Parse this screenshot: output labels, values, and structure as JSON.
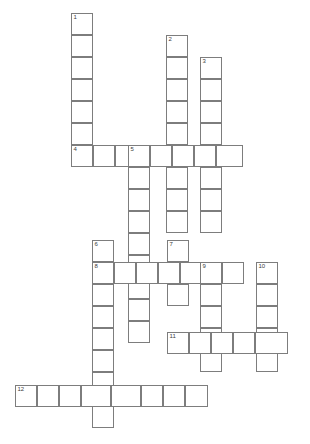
{
  "puzzle": {
    "type": "crossword-grid",
    "title": "",
    "cell_size": 21.8,
    "grid_origin": {
      "x": 15,
      "y": 13
    },
    "colors": {
      "cell_border": "#7d7d7d",
      "cell_fill": "#ffffff",
      "page_background": "#ffffff",
      "number_text": "#3c3c3c"
    },
    "entries": [
      {
        "number": "1",
        "direction": "down",
        "start_col": 3,
        "start_row": 0,
        "length": 7
      },
      {
        "number": "2",
        "direction": "down",
        "start_col": 7,
        "start_row": 1,
        "length": 13
      },
      {
        "number": "3",
        "direction": "down",
        "start_col": 8.5,
        "start_row": 2,
        "length": 12
      },
      {
        "number": "4",
        "direction": "across",
        "start_col": 3,
        "start_row": 6.2,
        "length": 8
      },
      {
        "number": "5",
        "direction": "down",
        "start_col": 5.6,
        "start_row": 6.2,
        "length": 10
      },
      {
        "number": "6",
        "direction": "down",
        "start_col": 4,
        "start_row": 10.4,
        "length": 9
      },
      {
        "number": "7",
        "direction": "down",
        "start_col": 7.2,
        "start_row": 10.4,
        "length": 4
      },
      {
        "number": "8",
        "direction": "across",
        "start_col": 4,
        "start_row": 11.4,
        "length": 7
      },
      {
        "number": "9",
        "direction": "down",
        "start_col": 8.7,
        "start_row": 11.4,
        "length": 5
      },
      {
        "number": "10",
        "direction": "down",
        "start_col": 11.2,
        "start_row": 11.4,
        "length": 5
      },
      {
        "number": "11",
        "direction": "across",
        "start_col": 7.2,
        "start_row": 14.6,
        "length": 5.5
      },
      {
        "number": "12",
        "direction": "across",
        "start_col": 0,
        "start_row": 17,
        "length": 9
      }
    ],
    "cells": [
      {
        "name": "cell-1-1",
        "x": 71,
        "y": 13,
        "w": 22,
        "h": 22,
        "num": "1"
      },
      {
        "name": "cell-1-2",
        "x": 71,
        "y": 35,
        "w": 22,
        "h": 22,
        "num": ""
      },
      {
        "name": "cell-1-3",
        "x": 71,
        "y": 57,
        "w": 22,
        "h": 22,
        "num": ""
      },
      {
        "name": "cell-1-4",
        "x": 71,
        "y": 79,
        "w": 22,
        "h": 22,
        "num": ""
      },
      {
        "name": "cell-1-5",
        "x": 71,
        "y": 101,
        "w": 22,
        "h": 22,
        "num": ""
      },
      {
        "name": "cell-1-6",
        "x": 71,
        "y": 123,
        "w": 22,
        "h": 22,
        "num": ""
      },
      {
        "name": "cell-1-7",
        "x": 71,
        "y": 145,
        "w": 22,
        "h": 22,
        "num": ""
      },
      {
        "name": "cell-2-1",
        "x": 166,
        "y": 35,
        "w": 22,
        "h": 22,
        "num": "2"
      },
      {
        "name": "cell-2-2",
        "x": 166,
        "y": 57,
        "w": 22,
        "h": 22,
        "num": ""
      },
      {
        "name": "cell-2-3",
        "x": 166,
        "y": 79,
        "w": 22,
        "h": 22,
        "num": ""
      },
      {
        "name": "cell-2-4",
        "x": 166,
        "y": 101,
        "w": 22,
        "h": 22,
        "num": ""
      },
      {
        "name": "cell-2-5",
        "x": 166,
        "y": 123,
        "w": 22,
        "h": 22,
        "num": ""
      },
      {
        "name": "cell-2-6",
        "x": 166,
        "y": 145,
        "w": 22,
        "h": 22,
        "num": ""
      },
      {
        "name": "cell-2-7",
        "x": 166,
        "y": 167,
        "w": 22,
        "h": 22,
        "num": ""
      },
      {
        "name": "cell-2-8",
        "x": 166,
        "y": 189,
        "w": 22,
        "h": 22,
        "num": ""
      },
      {
        "name": "cell-2-9",
        "x": 166,
        "y": 211,
        "w": 22,
        "h": 22,
        "num": ""
      },
      {
        "name": "cell-3-1",
        "x": 200,
        "y": 57,
        "w": 22,
        "h": 22,
        "num": "3"
      },
      {
        "name": "cell-3-2",
        "x": 200,
        "y": 79,
        "w": 22,
        "h": 22,
        "num": ""
      },
      {
        "name": "cell-3-3",
        "x": 200,
        "y": 101,
        "w": 22,
        "h": 22,
        "num": ""
      },
      {
        "name": "cell-3-4",
        "x": 200,
        "y": 123,
        "w": 22,
        "h": 22,
        "num": ""
      },
      {
        "name": "cell-3-5",
        "x": 200,
        "y": 145,
        "w": 22,
        "h": 22,
        "num": ""
      },
      {
        "name": "cell-3-6",
        "x": 200,
        "y": 167,
        "w": 22,
        "h": 22,
        "num": ""
      },
      {
        "name": "cell-3-7",
        "x": 200,
        "y": 189,
        "w": 22,
        "h": 22,
        "num": ""
      },
      {
        "name": "cell-3-8",
        "x": 200,
        "y": 211,
        "w": 22,
        "h": 22,
        "num": ""
      },
      {
        "name": "cell-4-1",
        "x": 71,
        "y": 145,
        "w": 22,
        "h": 22,
        "num": "4"
      },
      {
        "name": "cell-4-2",
        "x": 93,
        "y": 145,
        "w": 22,
        "h": 22,
        "num": ""
      },
      {
        "name": "cell-4-3",
        "x": 115,
        "y": 145,
        "w": 22,
        "h": 22,
        "num": ""
      },
      {
        "name": "cell-4-4",
        "x": 128,
        "y": 145,
        "w": 22,
        "h": 22,
        "num": "5"
      },
      {
        "name": "cell-4-5",
        "x": 150,
        "y": 145,
        "w": 22,
        "h": 22,
        "num": ""
      },
      {
        "name": "cell-4-6",
        "x": 172,
        "y": 145,
        "w": 22,
        "h": 22,
        "num": ""
      },
      {
        "name": "cell-4-7",
        "x": 194,
        "y": 145,
        "w": 22,
        "h": 22,
        "num": ""
      },
      {
        "name": "cell-4-8",
        "x": 216,
        "y": 145,
        "w": 27,
        "h": 22,
        "num": ""
      },
      {
        "name": "cell-5-2",
        "x": 128,
        "y": 167,
        "w": 22,
        "h": 22,
        "num": ""
      },
      {
        "name": "cell-5-3",
        "x": 128,
        "y": 189,
        "w": 22,
        "h": 22,
        "num": ""
      },
      {
        "name": "cell-5-4",
        "x": 128,
        "y": 211,
        "w": 22,
        "h": 22,
        "num": ""
      },
      {
        "name": "cell-5-5",
        "x": 128,
        "y": 233,
        "w": 22,
        "h": 22,
        "num": ""
      },
      {
        "name": "cell-5-6",
        "x": 128,
        "y": 255,
        "w": 22,
        "h": 22,
        "num": ""
      },
      {
        "name": "cell-5-7",
        "x": 128,
        "y": 277,
        "w": 22,
        "h": 22,
        "num": ""
      },
      {
        "name": "cell-5-8",
        "x": 128,
        "y": 299,
        "w": 22,
        "h": 22,
        "num": ""
      },
      {
        "name": "cell-5-9",
        "x": 128,
        "y": 321,
        "w": 22,
        "h": 22,
        "num": ""
      },
      {
        "name": "cell-6-1",
        "x": 92,
        "y": 240,
        "w": 22,
        "h": 22,
        "num": "6"
      },
      {
        "name": "cell-6-2",
        "x": 92,
        "y": 262,
        "w": 22,
        "h": 22,
        "num": "8"
      },
      {
        "name": "cell-6-3",
        "x": 92,
        "y": 284,
        "w": 22,
        "h": 22,
        "num": ""
      },
      {
        "name": "cell-6-4",
        "x": 92,
        "y": 306,
        "w": 22,
        "h": 22,
        "num": ""
      },
      {
        "name": "cell-6-5",
        "x": 92,
        "y": 328,
        "w": 22,
        "h": 22,
        "num": ""
      },
      {
        "name": "cell-6-6",
        "x": 92,
        "y": 350,
        "w": 22,
        "h": 22,
        "num": ""
      },
      {
        "name": "cell-6-7",
        "x": 92,
        "y": 372,
        "w": 22,
        "h": 22,
        "num": ""
      },
      {
        "name": "cell-6-8",
        "x": 92,
        "y": 394,
        "w": 22,
        "h": 22,
        "num": ""
      },
      {
        "name": "cell-6-9",
        "x": 92,
        "y": 406,
        "w": 22,
        "h": 22,
        "num": ""
      },
      {
        "name": "cell-7-1",
        "x": 167,
        "y": 240,
        "w": 22,
        "h": 22,
        "num": "7"
      },
      {
        "name": "cell-7-2",
        "x": 167,
        "y": 262,
        "w": 22,
        "h": 22,
        "num": ""
      },
      {
        "name": "cell-7-3",
        "x": 167,
        "y": 284,
        "w": 22,
        "h": 22,
        "num": ""
      },
      {
        "name": "cell-8-2",
        "x": 114,
        "y": 262,
        "w": 22,
        "h": 22,
        "num": ""
      },
      {
        "name": "cell-8-3",
        "x": 136,
        "y": 262,
        "w": 22,
        "h": 22,
        "num": ""
      },
      {
        "name": "cell-8-4",
        "x": 158,
        "y": 262,
        "w": 22,
        "h": 22,
        "num": ""
      },
      {
        "name": "cell-8-5",
        "x": 180,
        "y": 262,
        "w": 22,
        "h": 22,
        "num": ""
      },
      {
        "name": "cell-8-6",
        "x": 200,
        "y": 262,
        "w": 22,
        "h": 22,
        "num": "9"
      },
      {
        "name": "cell-8-7",
        "x": 222,
        "y": 262,
        "w": 22,
        "h": 22,
        "num": ""
      },
      {
        "name": "cell-9-2",
        "x": 200,
        "y": 284,
        "w": 22,
        "h": 22,
        "num": ""
      },
      {
        "name": "cell-9-3",
        "x": 200,
        "y": 306,
        "w": 22,
        "h": 22,
        "num": ""
      },
      {
        "name": "cell-9-4",
        "x": 200,
        "y": 328,
        "w": 22,
        "h": 22,
        "num": ""
      },
      {
        "name": "cell-9-5",
        "x": 200,
        "y": 350,
        "w": 22,
        "h": 22,
        "num": ""
      },
      {
        "name": "cell-10-1",
        "x": 256,
        "y": 262,
        "w": 22,
        "h": 22,
        "num": "10"
      },
      {
        "name": "cell-10-2",
        "x": 256,
        "y": 284,
        "w": 22,
        "h": 22,
        "num": ""
      },
      {
        "name": "cell-10-3",
        "x": 256,
        "y": 306,
        "w": 22,
        "h": 22,
        "num": ""
      },
      {
        "name": "cell-10-4",
        "x": 256,
        "y": 328,
        "w": 22,
        "h": 22,
        "num": ""
      },
      {
        "name": "cell-10-5",
        "x": 256,
        "y": 350,
        "w": 22,
        "h": 22,
        "num": ""
      },
      {
        "name": "cell-11-1",
        "x": 167,
        "y": 332,
        "w": 22,
        "h": 22,
        "num": "11"
      },
      {
        "name": "cell-11-2",
        "x": 189,
        "y": 332,
        "w": 22,
        "h": 22,
        "num": ""
      },
      {
        "name": "cell-11-3",
        "x": 211,
        "y": 332,
        "w": 22,
        "h": 22,
        "num": ""
      },
      {
        "name": "cell-11-4",
        "x": 233,
        "y": 332,
        "w": 22,
        "h": 22,
        "num": ""
      },
      {
        "name": "cell-11-5",
        "x": 255,
        "y": 332,
        "w": 33,
        "h": 22,
        "num": ""
      },
      {
        "name": "cell-12-1",
        "x": 15,
        "y": 385,
        "w": 22,
        "h": 22,
        "num": "12"
      },
      {
        "name": "cell-12-2",
        "x": 37,
        "y": 385,
        "w": 22,
        "h": 22,
        "num": ""
      },
      {
        "name": "cell-12-3",
        "x": 59,
        "y": 385,
        "w": 22,
        "h": 22,
        "num": ""
      },
      {
        "name": "cell-12-4",
        "x": 81,
        "y": 385,
        "w": 30,
        "h": 22,
        "num": ""
      },
      {
        "name": "cell-12-5",
        "x": 111,
        "y": 385,
        "w": 30,
        "h": 22,
        "num": ""
      },
      {
        "name": "cell-12-6",
        "x": 141,
        "y": 385,
        "w": 22,
        "h": 22,
        "num": ""
      },
      {
        "name": "cell-12-7",
        "x": 163,
        "y": 385,
        "w": 22,
        "h": 22,
        "num": ""
      },
      {
        "name": "cell-12-8",
        "x": 185,
        "y": 385,
        "w": 23,
        "h": 22,
        "num": ""
      }
    ]
  }
}
